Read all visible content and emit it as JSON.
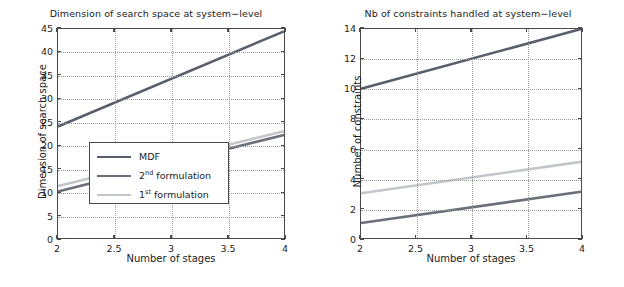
{
  "figure": {
    "panels": [
      "left",
      "right"
    ]
  },
  "colors": {
    "mdf": "#585f6b",
    "formulation2": "#6b6f77",
    "formulation1": "#c3c6c9",
    "axis": "#4a4a4a",
    "grid": "#9a9a9a",
    "text": "#1c1c1c",
    "background": "#ffffff"
  },
  "legend": {
    "position": "bottom-right-of-left-panel",
    "entries": [
      {
        "label": "MDF",
        "sup": "",
        "suffix": "",
        "color": "#585f6b"
      },
      {
        "label": "2",
        "sup": "nd",
        "suffix": " formulation",
        "color": "#6b6f77"
      },
      {
        "label": "1",
        "sup": "st",
        "suffix": " formulation",
        "color": "#c3c6c9"
      }
    ]
  },
  "chart_data": [
    {
      "type": "line",
      "title": "Dimension of search space at system−level",
      "xlabel": "Number of stages",
      "ylabel": "Dimension of search space",
      "xlim": [
        2,
        4
      ],
      "ylim": [
        0,
        45
      ],
      "xticks": [
        2,
        2.5,
        3,
        3.5,
        4
      ],
      "xticklabels": [
        "2",
        "2.5",
        "3",
        "3.5",
        "4"
      ],
      "yticks": [
        0,
        5,
        10,
        15,
        20,
        25,
        30,
        35,
        40,
        45
      ],
      "yticklabels": [
        "0",
        "5",
        "10",
        "15",
        "20",
        "25",
        "30",
        "35",
        "40",
        "45"
      ],
      "grid": true,
      "legend_position": "lower right",
      "x": [
        2,
        4
      ],
      "series": [
        {
          "name": "MDF",
          "values": [
            24,
            44.5
          ],
          "color": "#585f6b"
        },
        {
          "name": "2nd formulation",
          "values": [
            10,
            22.2
          ],
          "color": "#6b6f77"
        },
        {
          "name": "1st formulation",
          "values": [
            11.2,
            23.0
          ],
          "color": "#c3c6c9"
        }
      ]
    },
    {
      "type": "line",
      "title": "Nb of constraints handled at system−level",
      "xlabel": "Number of stages",
      "ylabel": "Number of constraints",
      "xlim": [
        2,
        4
      ],
      "ylim": [
        0,
        14
      ],
      "xticks": [
        2,
        2.5,
        3,
        3.5,
        4
      ],
      "xticklabels": [
        "2",
        "2.5",
        "3",
        "3.5",
        "4"
      ],
      "yticks": [
        0,
        2,
        4,
        6,
        8,
        10,
        12,
        14
      ],
      "yticklabels": [
        "0",
        "2",
        "4",
        "6",
        "8",
        "10",
        "12",
        "14"
      ],
      "grid": true,
      "legend_position": "none",
      "x": [
        2,
        4
      ],
      "series": [
        {
          "name": "MDF",
          "values": [
            10,
            14
          ],
          "color": "#585f6b"
        },
        {
          "name": "1st formulation",
          "values": [
            3.0,
            5.1
          ],
          "color": "#c3c6c9"
        },
        {
          "name": "2nd formulation",
          "values": [
            1.0,
            3.1
          ],
          "color": "#6b6f77"
        }
      ]
    }
  ]
}
